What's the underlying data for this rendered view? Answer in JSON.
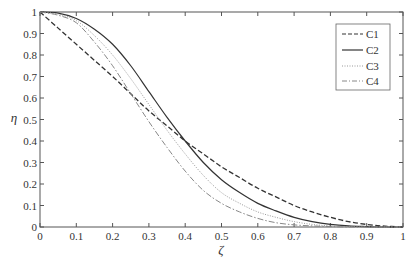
{
  "chart_data": {
    "type": "line",
    "title": "",
    "xlabel": "ζ",
    "ylabel": "η",
    "xlim": [
      0,
      1
    ],
    "ylim": [
      0,
      1
    ],
    "grid": false,
    "legend_position": "upper right",
    "x_ticks": [
      "0",
      "0.1",
      "0.2",
      "0.3",
      "0.4",
      "0.5",
      "0.6",
      "0.7",
      "0.8",
      "0.9",
      "1"
    ],
    "y_ticks": [
      "0",
      "0.1",
      "0.2",
      "0.3",
      "0.4",
      "0.5",
      "0.6",
      "0.7",
      "0.8",
      "0.9",
      "1"
    ],
    "x": [
      0,
      0.05,
      0.1,
      0.15,
      0.2,
      0.25,
      0.3,
      0.35,
      0.4,
      0.45,
      0.5,
      0.55,
      0.6,
      0.65,
      0.7,
      0.75,
      0.8,
      0.85,
      0.9,
      0.95,
      1.0
    ],
    "series": [
      {
        "name": "C1",
        "style": "dashed",
        "values": [
          1.0,
          0.925,
          0.85,
          0.775,
          0.7,
          0.62,
          0.54,
          0.47,
          0.4,
          0.34,
          0.28,
          0.23,
          0.18,
          0.14,
          0.1,
          0.07,
          0.045,
          0.025,
          0.012,
          0.004,
          0.0
        ]
      },
      {
        "name": "C2",
        "style": "solid",
        "values": [
          1.0,
          0.995,
          0.97,
          0.92,
          0.85,
          0.75,
          0.63,
          0.51,
          0.4,
          0.3,
          0.22,
          0.16,
          0.11,
          0.075,
          0.045,
          0.025,
          0.012,
          0.005,
          0.002,
          0.0,
          0.0
        ]
      },
      {
        "name": "C3",
        "style": "dotted",
        "values": [
          1.0,
          0.99,
          0.96,
          0.89,
          0.8,
          0.69,
          0.57,
          0.45,
          0.34,
          0.24,
          0.16,
          0.11,
          0.07,
          0.045,
          0.025,
          0.012,
          0.005,
          0.002,
          0.0,
          0.0,
          0.0
        ]
      },
      {
        "name": "C4",
        "style": "dash-dot",
        "values": [
          1.0,
          0.985,
          0.95,
          0.86,
          0.75,
          0.62,
          0.49,
          0.37,
          0.26,
          0.17,
          0.11,
          0.07,
          0.04,
          0.02,
          0.01,
          0.005,
          0.002,
          0.0,
          0.0,
          0.0,
          0.0
        ]
      }
    ]
  },
  "legend": {
    "items": [
      {
        "label": "C1"
      },
      {
        "label": "C2"
      },
      {
        "label": "C3"
      },
      {
        "label": "C4"
      }
    ]
  },
  "colors": {
    "axis": "#555555",
    "C1": "#333333",
    "C2": "#333333",
    "C3": "#999999",
    "C4": "#888888"
  }
}
